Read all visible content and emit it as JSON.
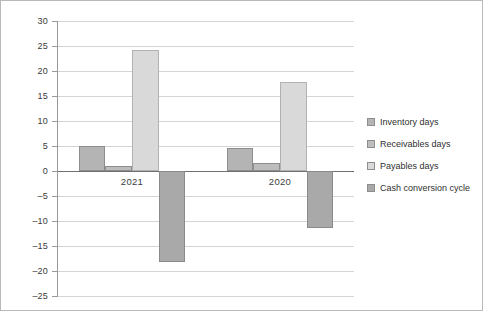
{
  "chart_data": {
    "type": "bar",
    "title": "",
    "subtitle": "",
    "xlabel": "",
    "ylabel": "",
    "categories": [
      "2021",
      "2020"
    ],
    "series": [
      {
        "name": "Inventory days",
        "color": "#b4b4b4",
        "values": [
          5.0,
          4.6
        ]
      },
      {
        "name": "Receivables days",
        "color": "#bdbdbd",
        "values": [
          1.0,
          1.6
        ]
      },
      {
        "name": "Payables days",
        "color": "#d9d9d9",
        "values": [
          24.3,
          17.8
        ]
      },
      {
        "name": "Cash conversion cycle",
        "color": "#a9a9a9",
        "values": [
          -18.2,
          -11.4
        ]
      }
    ],
    "ylim": [
      -25,
      30
    ],
    "ytick_step": 5,
    "yticks": [
      30,
      25,
      20,
      15,
      10,
      5,
      0,
      -5,
      -10,
      -15,
      -20,
      -25
    ],
    "ytick_labels": [
      "30",
      "25",
      "20",
      "15",
      "10",
      "5",
      "0",
      "–5",
      "–10",
      "–15",
      "–20",
      "–25"
    ],
    "grid": true,
    "grid_axis": "y",
    "legend_position": "right",
    "zero_line": true
  },
  "legend": {
    "items": [
      {
        "label": "Inventory days"
      },
      {
        "label": "Receivables days"
      },
      {
        "label": "Payables days"
      },
      {
        "label": "Cash conversion cycle"
      }
    ]
  }
}
